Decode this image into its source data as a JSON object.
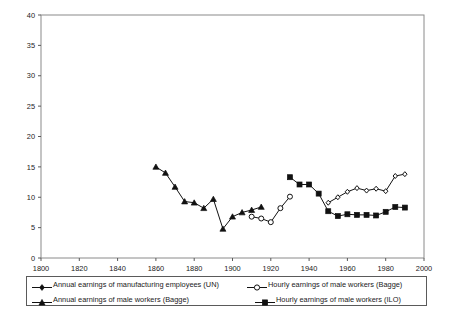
{
  "chart_data": {
    "type": "line",
    "title": "",
    "xlabel": "",
    "ylabel": "",
    "xlim": [
      1800,
      2000
    ],
    "ylim": [
      0,
      40
    ],
    "xticks": [
      1800,
      1820,
      1840,
      1860,
      1880,
      1900,
      1920,
      1940,
      1960,
      1980,
      2000
    ],
    "yticks": [
      0,
      5,
      10,
      15,
      20,
      25,
      30,
      35,
      40
    ],
    "grid": false,
    "legend_position": "below-plot",
    "series": [
      {
        "name": "Annual earnings of manufacturing employees (UN)",
        "marker": "diamond-small",
        "marker_fill": "filled",
        "x": [
          1950,
          1955,
          1960,
          1965,
          1970,
          1975,
          1980,
          1985,
          1990
        ],
        "values": [
          9.1,
          10.0,
          10.9,
          11.5,
          11.1,
          11.4,
          11.0,
          13.5,
          13.8
        ]
      },
      {
        "name": "Annual earnings of male workers (Bagge)",
        "marker": "triangle",
        "marker_fill": "filled",
        "x": [
          1860,
          1865,
          1870,
          1875,
          1880,
          1885,
          1890,
          1895,
          1900,
          1905,
          1910,
          1915
        ],
        "values": [
          15.0,
          14.0,
          11.7,
          9.3,
          9.1,
          8.2,
          9.7,
          4.8,
          6.8,
          7.5,
          7.9,
          8.4
        ]
      },
      {
        "name": "Hourly earnings of male workers (Bagge)",
        "marker": "circle",
        "marker_fill": "open",
        "x": [
          1910,
          1915,
          1920,
          1925,
          1930
        ],
        "values": [
          6.8,
          6.5,
          5.9,
          8.2,
          10.1
        ]
      },
      {
        "name": "Hourly earnings of male workers (ILO)",
        "marker": "square",
        "marker_fill": "filled",
        "x": [
          1930,
          1935,
          1940,
          1945,
          1950,
          1955,
          1960,
          1965,
          1970,
          1975,
          1980,
          1985,
          1990
        ],
        "values": [
          13.3,
          12.1,
          12.1,
          10.6,
          7.7,
          6.9,
          7.2,
          7.1,
          7.1,
          7.0,
          7.6,
          8.4,
          8.3
        ]
      }
    ]
  },
  "legend": {
    "entries": [
      {
        "label": "Annual earnings of manufacturing employees (UN)",
        "marker": "diamond-small"
      },
      {
        "label": "Hourly earnings of male workers (Bagge)",
        "marker": "circle"
      },
      {
        "label": "Annual earnings of male workers (Bagge)",
        "marker": "triangle"
      },
      {
        "label": "Hourly earnings of male workers (ILO)",
        "marker": "square"
      }
    ]
  },
  "colors": {
    "line": "#111111",
    "axis": "#5a5a5a",
    "text": "#1a1a1a",
    "background": "#ffffff"
  }
}
